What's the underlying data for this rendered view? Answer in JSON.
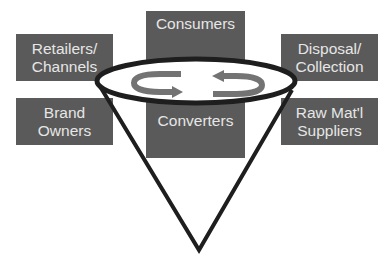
{
  "diagram": {
    "type": "value-chain-funnel",
    "colors": {
      "box_fill": "#5a5a5a",
      "box_text": "#e6e6e6",
      "ellipse_stroke": "#1e1e1e",
      "cone_stroke": "#1e1e1e",
      "arrow_fill": "#737373",
      "background": "#ffffff"
    },
    "boxes": {
      "consumers": {
        "lines": [
          "Consumers"
        ]
      },
      "retailers": {
        "lines": [
          "Retailers/",
          "Channels"
        ]
      },
      "brand_owners": {
        "lines": [
          "Brand",
          "Owners"
        ]
      },
      "disposal": {
        "lines": [
          "Disposal/",
          "Collection"
        ]
      },
      "raw_materials": {
        "lines": [
          "Raw Mat'l",
          "Suppliers"
        ]
      },
      "converters": {
        "lines": [
          "Converters"
        ]
      }
    },
    "center": {
      "shape": "ellipse",
      "arrows": [
        "circular-arrow-clockwise-left",
        "circular-arrow-counterclockwise-right"
      ]
    },
    "cone": {
      "shape": "inverted-cone",
      "apex": "bottom-center"
    }
  }
}
